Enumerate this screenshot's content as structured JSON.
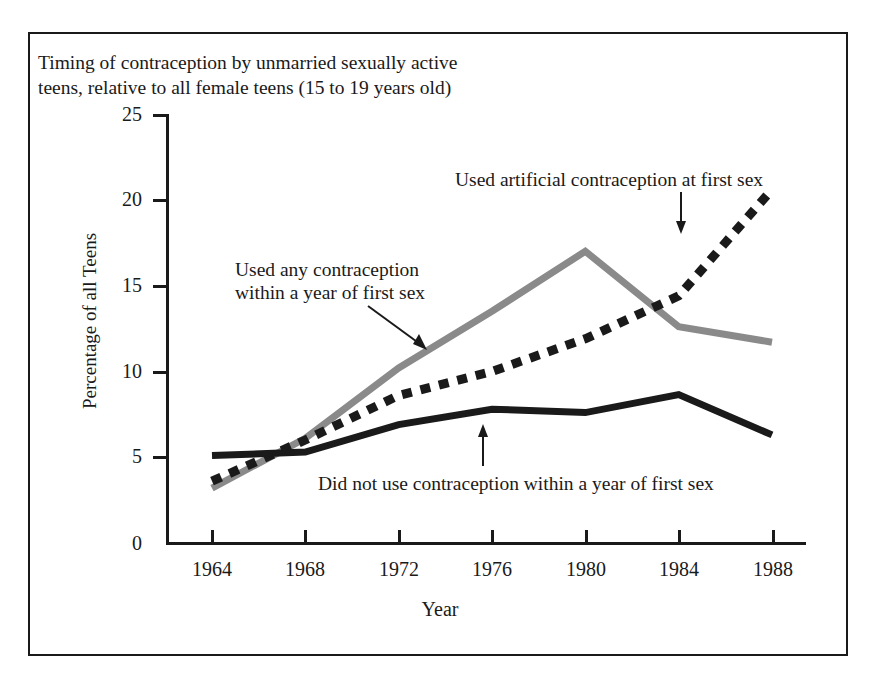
{
  "title": {
    "line1": "Timing of contraception by unmarried sexually active",
    "line2": "teens, relative to all female teens (15 to 19 years old)"
  },
  "axes": {
    "ylabel": "Percentage of all Teens",
    "xlabel": "Year",
    "yticks": [
      "25",
      "20",
      "15",
      "10",
      "5",
      "0"
    ],
    "xticks": [
      "1964",
      "1968",
      "1972",
      "1976",
      "1980",
      "1984",
      "1988"
    ]
  },
  "annotations": {
    "artificial": "Used artificial contraception at first sex",
    "any_line1": "Used any contraception",
    "any_line2": "within a year of first sex",
    "didnot": "Did not use contraception within a year of first sex"
  },
  "colors": {
    "ink": "#1a1a1a",
    "gray_series": "#8a8a8a",
    "background": "#ffffff"
  },
  "chart_data": {
    "type": "line",
    "title": "Timing of contraception by unmarried sexually active teens, relative to all female teens (15 to 19 years old)",
    "xlabel": "Year",
    "ylabel": "Percentage of all Teens",
    "xlim": [
      1964,
      1988
    ],
    "ylim": [
      0,
      25
    ],
    "yticks": [
      0,
      5,
      10,
      15,
      20,
      25
    ],
    "xticks": [
      1964,
      1968,
      1972,
      1976,
      1980,
      1984,
      1988
    ],
    "grid": false,
    "legend": "annotations-with-arrows",
    "x": [
      1964,
      1968,
      1972,
      1976,
      1980,
      1984,
      1988
    ],
    "series": [
      {
        "name": "Used any contraception within a year of first sex",
        "style": "solid-gray-thick",
        "color": "#8a8a8a",
        "values": [
          3.2,
          6.1,
          10.2,
          13.5,
          17.0,
          12.6,
          11.7
        ]
      },
      {
        "name": "Used artificial contraception at first sex",
        "style": "dashed-black-thick",
        "color": "#1a1a1a",
        "values": [
          3.6,
          6.0,
          8.6,
          10.0,
          11.9,
          14.4,
          20.6
        ]
      },
      {
        "name": "Did not use contraception within a year of first sex",
        "style": "solid-black-thick",
        "color": "#1a1a1a",
        "values": [
          5.1,
          5.3,
          6.9,
          7.8,
          7.6,
          8.65,
          6.3
        ]
      }
    ]
  }
}
